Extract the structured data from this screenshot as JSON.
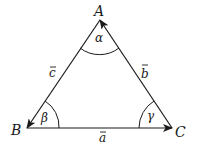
{
  "diagram": {
    "type": "vector-triangle",
    "vertices": {
      "A": {
        "label": "A"
      },
      "B": {
        "label": "B"
      },
      "C": {
        "label": "C"
      }
    },
    "angles": {
      "alpha": "α",
      "beta": "β",
      "gamma": "γ"
    },
    "sides": {
      "a": "a",
      "b": "b",
      "c": "c"
    },
    "colors": {
      "stroke": "#1a1a1a",
      "background": "#ffffff"
    }
  }
}
